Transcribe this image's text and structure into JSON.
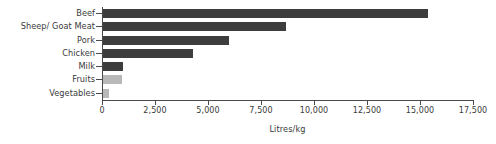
{
  "chart_data": {
    "type": "bar",
    "orientation": "horizontal",
    "title": "",
    "xlabel": "Litres/kg",
    "ylabel": "",
    "categories": [
      "Beef",
      "Sheep/ Goat Meat",
      "Pork",
      "Chicken",
      "Milk",
      "Fruits",
      "Vegetables"
    ],
    "values": [
      15400,
      8700,
      6000,
      4300,
      1000,
      960,
      320
    ],
    "bar_colors": [
      "#3d3d3d",
      "#3d3d3d",
      "#3d3d3d",
      "#3d3d3d",
      "#3d3d3d",
      "#b8b8b8",
      "#b8b8b8"
    ],
    "xlim": [
      0,
      17500
    ],
    "xticks": [
      0,
      2500,
      5000,
      7500,
      10000,
      12500,
      15000,
      17500
    ],
    "xticklabels": [
      "0",
      "2,500",
      "5,000",
      "7,500",
      "10,000",
      "12,500",
      "15,000",
      "17,500"
    ],
    "grid": false,
    "legend": null,
    "background": "#ffffff",
    "axis_color": "#4a4a4a",
    "text_color": "#3a3a3a"
  }
}
